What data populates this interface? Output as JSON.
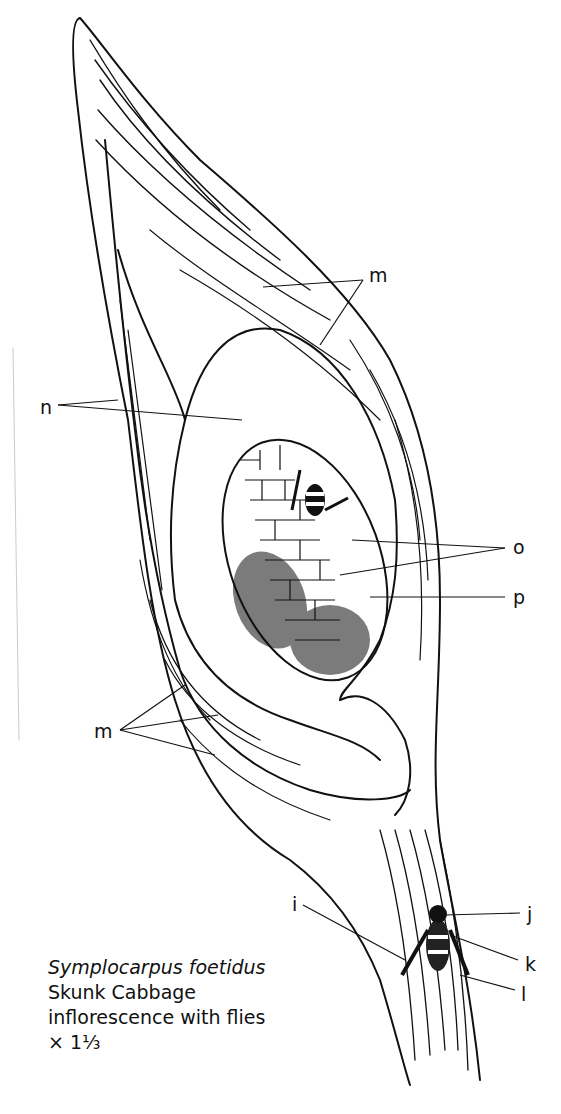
{
  "figure": {
    "caption": {
      "scientific_name": "Symplocarpus foetidus",
      "common_name": "Skunk Cabbage",
      "description": "inflorescence with flies",
      "magnification": "× 1⅓"
    },
    "labels": [
      {
        "id": "m-top",
        "text": "m",
        "x": 369,
        "y": 266
      },
      {
        "id": "n",
        "text": "n",
        "x": 40,
        "y": 398
      },
      {
        "id": "o",
        "text": "o",
        "x": 513,
        "y": 538
      },
      {
        "id": "p",
        "text": "p",
        "x": 513,
        "y": 588
      },
      {
        "id": "m-bottom",
        "text": "m",
        "x": 94,
        "y": 722
      },
      {
        "id": "i",
        "text": "i",
        "x": 292,
        "y": 895
      },
      {
        "id": "j",
        "text": "j",
        "x": 527,
        "y": 905
      },
      {
        "id": "k",
        "text": "k",
        "x": 525,
        "y": 955
      },
      {
        "id": "l",
        "text": "l",
        "x": 521,
        "y": 985
      }
    ],
    "colors": {
      "ink": "#111111",
      "paper": "#ffffff"
    }
  }
}
